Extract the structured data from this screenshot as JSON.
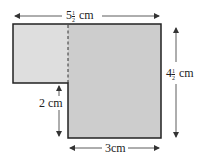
{
  "diagram": {
    "type": "composite-rectangle (L-shape)",
    "colors": {
      "left_fill": "#dedede",
      "right_fill": "#cdcdcd",
      "outline": "#222222",
      "arrow": "#333333"
    },
    "labels": {
      "top_width": {
        "whole": "5",
        "num": "1",
        "den": "2",
        "unit": "cm"
      },
      "right_height": {
        "whole": "4",
        "num": "1",
        "den": "2",
        "unit": "cm"
      },
      "left_step_height": {
        "text": "2 cm"
      },
      "bottom_width": {
        "text": "3cm"
      }
    }
  }
}
